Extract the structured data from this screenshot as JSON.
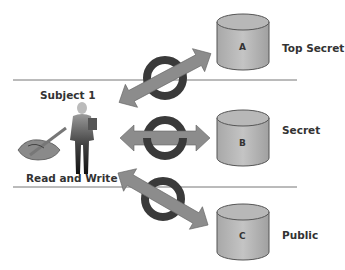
{
  "subject": {
    "name": "Subject 1",
    "permissions": "Read and Write"
  },
  "levels": [
    {
      "object": "A",
      "classification": "Top Secret",
      "access": "blocked"
    },
    {
      "object": "B",
      "classification": "Secret",
      "access": "allowed"
    },
    {
      "object": "C",
      "classification": "Public",
      "access": "blocked"
    }
  ],
  "colors": {
    "arrow": "#8c8c8c",
    "ring": "#3c3c3c",
    "cylinder": "#b4b4b4",
    "line": "#666666"
  }
}
